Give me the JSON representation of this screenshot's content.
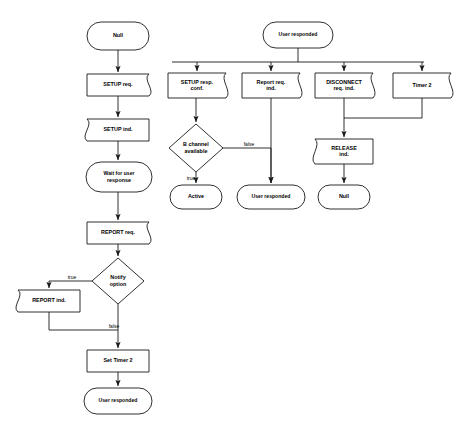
{
  "diagram": {
    "type": "flowchart",
    "background_color": "#ffffff",
    "line_color": "#1a1a1a",
    "nodes": [
      {
        "id": "null-start",
        "label": "Null",
        "lines": [
          "Null"
        ],
        "shape": "terminal",
        "x": 88,
        "y": 22,
        "w": 60,
        "h": 28
      },
      {
        "id": "setup-req",
        "label": "SETUP req.",
        "lines": [
          "SETUP req."
        ],
        "shape": "send",
        "x": 87,
        "y": 74,
        "w": 62,
        "h": 22
      },
      {
        "id": "setup-ind",
        "label": "SETUP ind.",
        "lines": [
          "SETUP ind."
        ],
        "shape": "receive",
        "x": 87,
        "y": 119,
        "w": 62,
        "h": 22
      },
      {
        "id": "wait-for-user",
        "label": "Wait for user response",
        "lines": [
          "Wait for user",
          "response"
        ],
        "shape": "terminal",
        "x": 88,
        "y": 162,
        "w": 62,
        "h": 30
      },
      {
        "id": "report-req",
        "label": "REPORT req.",
        "lines": [
          "REPORT req."
        ],
        "shape": "send",
        "x": 87,
        "y": 222,
        "w": 62,
        "h": 22
      },
      {
        "id": "notify-option",
        "label": "Notify option",
        "lines": [
          "Notify",
          "option"
        ],
        "shape": "decision",
        "x": 92,
        "y": 258,
        "w": 52,
        "h": 46
      },
      {
        "id": "report-ind",
        "label": "REPORT ind.",
        "lines": [
          "REPORT ind."
        ],
        "shape": "receive",
        "x": 18,
        "y": 290,
        "w": 62,
        "h": 22
      },
      {
        "id": "set-timer-2",
        "label": "Set Timer 2",
        "lines": [
          "Set Timer 2"
        ],
        "shape": "process",
        "x": 87,
        "y": 350,
        "w": 62,
        "h": 22
      },
      {
        "id": "user-responded-end",
        "label": "User responded",
        "lines": [
          "User responded"
        ],
        "shape": "terminal",
        "x": 84,
        "y": 388,
        "w": 68,
        "h": 26
      },
      {
        "id": "user-responded-start",
        "label": "User responded",
        "lines": [
          "User responded"
        ],
        "shape": "terminal",
        "x": 263,
        "y": 22,
        "w": 70,
        "h": 26
      },
      {
        "id": "setup-resp-conf",
        "label": "SETUP resp. conf.",
        "lines": [
          "SETUP resp.",
          "conf."
        ],
        "shape": "send",
        "x": 168,
        "y": 73,
        "w": 58,
        "h": 25
      },
      {
        "id": "report-req-ind",
        "label": "Report req. ind.",
        "lines": [
          "Report req.",
          "ind."
        ],
        "shape": "send",
        "x": 242,
        "y": 73,
        "w": 58,
        "h": 25
      },
      {
        "id": "disconnect-req-ind",
        "label": "DISCONNECT req. ind.",
        "lines": [
          "DISCONNECT",
          "req. ind."
        ],
        "shape": "send",
        "x": 315,
        "y": 73,
        "w": 58,
        "h": 25
      },
      {
        "id": "timer-2",
        "label": "Timer 2",
        "lines": [
          "Timer 2"
        ],
        "shape": "send",
        "x": 393,
        "y": 73,
        "w": 58,
        "h": 25
      },
      {
        "id": "b-channel-avail",
        "label": "B channel available",
        "lines": [
          "B channel",
          "available"
        ],
        "shape": "decision",
        "x": 169,
        "y": 124,
        "w": 54,
        "h": 48
      },
      {
        "id": "release-ind",
        "label": "RELEASE ind.",
        "lines": [
          "RELEASE",
          "ind."
        ],
        "shape": "receive",
        "x": 315,
        "y": 139,
        "w": 58,
        "h": 25
      },
      {
        "id": "active-state",
        "label": "Active",
        "lines": [
          "Active"
        ],
        "shape": "terminal",
        "x": 170,
        "y": 185,
        "w": 52,
        "h": 24
      },
      {
        "id": "user-responded-mid",
        "label": "User responded",
        "lines": [
          "User responded"
        ],
        "shape": "terminal",
        "x": 237,
        "y": 185,
        "w": 68,
        "h": 24
      },
      {
        "id": "null-end",
        "label": "Null",
        "lines": [
          "Null"
        ],
        "shape": "terminal",
        "x": 318,
        "y": 185,
        "w": 52,
        "h": 24
      }
    ],
    "edges": [
      {
        "id": "e-null-setupreq",
        "from": "null-start",
        "to": "setup-req",
        "label": "",
        "path": "M118,50 L118,72",
        "arrow": true
      },
      {
        "id": "e-setupreq-setupind",
        "from": "setup-req",
        "to": "setup-ind",
        "label": "",
        "path": "M118,96 L118,117",
        "arrow": true
      },
      {
        "id": "e-setupind-wait",
        "from": "setup-ind",
        "to": "wait-for-user",
        "label": "",
        "path": "M118,141 L118,160",
        "arrow": true
      },
      {
        "id": "e-wait-reportreq",
        "from": "wait-for-user",
        "to": "report-req",
        "label": "",
        "path": "M118,192 L118,220",
        "arrow": true
      },
      {
        "id": "e-reportreq-notify",
        "from": "report-req",
        "to": "notify-option",
        "label": "",
        "path": "M118,244 L118,256",
        "arrow": true
      },
      {
        "id": "e-notify-true",
        "from": "notify-option",
        "to": "report-ind",
        "label": "true",
        "path": "M92,281 L49,281 L49,288",
        "arrow": true
      },
      {
        "id": "e-notify-false",
        "from": "notify-option",
        "to": "set-timer-2",
        "label": "false",
        "path": "M118,304 L118,348",
        "arrow": true
      },
      {
        "id": "e-reportind-merge",
        "from": "report-ind",
        "to": "set-timer-2",
        "label": "",
        "path": "M49,312 L49,330 L118,330",
        "arrow": false
      },
      {
        "id": "e-settimer-userresp",
        "from": "set-timer-2",
        "to": "user-responded-end",
        "label": "",
        "path": "M118,372 L118,386",
        "arrow": true
      },
      {
        "id": "e-ur-bus",
        "from": "user-responded-start",
        "to": "distribution-bus",
        "label": "",
        "path": "M298,48 L298,62 M172,62 L424,62",
        "arrow": false
      },
      {
        "id": "e-bus-setupresp",
        "from": "distribution-bus",
        "to": "setup-resp-conf",
        "label": "",
        "path": "M197,62 L197,71",
        "arrow": true
      },
      {
        "id": "e-bus-reportreqind",
        "from": "distribution-bus",
        "to": "report-req-ind",
        "label": "",
        "path": "M271,62 L271,71",
        "arrow": true
      },
      {
        "id": "e-bus-disconnect",
        "from": "distribution-bus",
        "to": "disconnect-req-ind",
        "label": "",
        "path": "M344,62 L344,71",
        "arrow": true
      },
      {
        "id": "e-bus-timer2",
        "from": "distribution-bus",
        "to": "timer-2",
        "label": "",
        "path": "M422,62 L422,71",
        "arrow": true
      },
      {
        "id": "e-setupresp-bchan",
        "from": "setup-resp-conf",
        "to": "b-channel-avail",
        "label": "",
        "path": "M196,98 L196,122",
        "arrow": true
      },
      {
        "id": "e-bchan-true",
        "from": "b-channel-avail",
        "to": "active-state",
        "label": "true",
        "path": "M196,172 L196,183",
        "arrow": true
      },
      {
        "id": "e-bchan-false",
        "from": "b-channel-avail",
        "to": "user-responded-mid",
        "label": "false",
        "path": "M223,148 L271,148 L271,183",
        "arrow": true
      },
      {
        "id": "e-reportreqind-userresp",
        "from": "report-req-ind",
        "to": "user-responded-mid",
        "label": "",
        "path": "M271,98 L271,183",
        "arrow": true
      },
      {
        "id": "e-disconnect-release",
        "from": "disconnect-req-ind",
        "to": "release-ind",
        "label": "",
        "path": "M344,98 L344,137",
        "arrow": true
      },
      {
        "id": "e-timer2-merge",
        "from": "timer-2",
        "to": "release-ind",
        "label": "",
        "path": "M422,98 L422,118 L344,118",
        "arrow": false
      },
      {
        "id": "e-release-null",
        "from": "release-ind",
        "to": "null-end",
        "label": "",
        "path": "M344,164 L344,183",
        "arrow": true
      }
    ],
    "edge_labels": [
      {
        "id": "lbl-notify-true",
        "text": "true",
        "x": 72,
        "y": 278
      },
      {
        "id": "lbl-notify-false",
        "text": "false",
        "x": 114,
        "y": 327
      },
      {
        "id": "lbl-bchan-true",
        "text": "true",
        "x": 191,
        "y": 179
      },
      {
        "id": "lbl-bchan-false",
        "text": "false",
        "x": 249,
        "y": 145
      }
    ]
  }
}
